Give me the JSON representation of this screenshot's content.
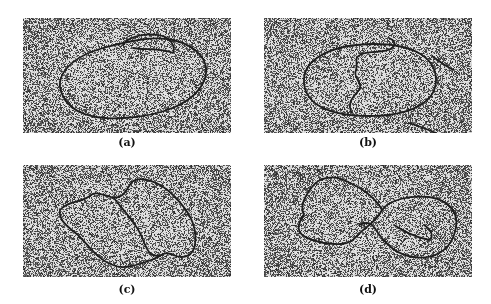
{
  "figure": {
    "panels": [
      {
        "id": "a",
        "label": "(a)",
        "description": "electron micrograph: large elliptical circular molecule with small side loop"
      },
      {
        "id": "b",
        "label": "(b)",
        "description": "electron micrograph: elliptical circular molecule with internal wavy strand"
      },
      {
        "id": "c",
        "label": "(c)",
        "description": "electron micrograph: twisted figure-like double loop molecule"
      },
      {
        "id": "d",
        "label": "(d)",
        "description": "electron micrograph: figure-eight shaped molecule with two lobes"
      }
    ],
    "colors": {
      "background": "#ffffff",
      "grain_light": "#e6e6e6",
      "grain_dark": "#1a1a1a",
      "contour": "#1e1e1e"
    }
  }
}
